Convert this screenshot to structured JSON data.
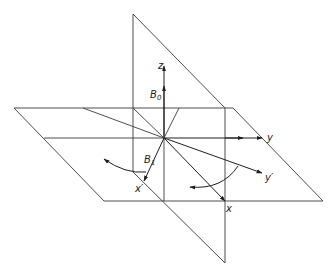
{
  "diagram": {
    "labels": {
      "z": "z",
      "B0_main": "B",
      "B0_sub": "0",
      "B1_main": "B",
      "B1_sub": "1",
      "y": "y",
      "y_prime": "y′",
      "x": "x",
      "x_prime": "x′"
    },
    "colors": {
      "line": "#3a3a3a",
      "axis": "#1e1e1e",
      "background": "#ffffff"
    }
  }
}
